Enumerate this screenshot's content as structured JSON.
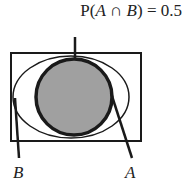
{
  "diagram": {
    "title": {
      "prefix": "P(",
      "set_a": "A",
      "operator": " ∩ ",
      "set_b": "B",
      "suffix": ") = 0.5"
    },
    "universe": {
      "shape": "rectangle"
    },
    "sets": [
      {
        "id": "B",
        "label": "B",
        "shape": "ellipse",
        "fill": "#ffffff"
      },
      {
        "id": "A",
        "label": "A",
        "shape": "circle",
        "fill": "#a0a0a0",
        "subset_of": "B"
      }
    ],
    "annotation": "Shaded region A ∩ B = A",
    "colors": {
      "stroke": "#1a1a1a",
      "shade": "#a0a0a0",
      "background": "#ffffff"
    }
  }
}
